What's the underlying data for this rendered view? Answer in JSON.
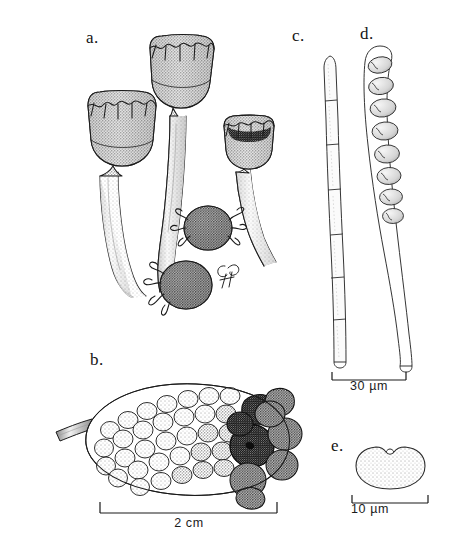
{
  "figure": {
    "type": "scientific-illustration-plate",
    "background_color": "#ffffff",
    "ink_color": "#1a1a1a",
    "signature": "GH"
  },
  "panels": [
    {
      "id": "a",
      "label": "a.",
      "subject": "stalked cup-shaped apothecia arising from sclerotia",
      "scale_bar": null
    },
    {
      "id": "b",
      "label": "b.",
      "subject": "mummified fruit encrusted with sclerotia, with pedicel",
      "scale_bar": {
        "text": "2 cm",
        "value": 2,
        "unit": "cm"
      }
    },
    {
      "id": "c",
      "label": "c.",
      "subject": "septate paraphysis",
      "scale_bar": {
        "text": "30 µm",
        "value": 30,
        "unit": "µm"
      }
    },
    {
      "id": "d",
      "label": "d.",
      "subject": "ascus containing eight ascospores",
      "scale_bar": {
        "text": "30 µm",
        "value": 30,
        "unit": "µm"
      }
    },
    {
      "id": "e",
      "label": "e.",
      "subject": "germinating ascospore with bud",
      "scale_bar": {
        "text": "10 µm",
        "value": 10,
        "unit": "µm"
      }
    }
  ],
  "scale_bars": {
    "panel_b": "2 cm",
    "panel_cd": "30 µm",
    "panel_e": "10 µm"
  },
  "labels": {
    "a": "a.",
    "b": "b.",
    "c": "c.",
    "d": "d.",
    "e": "e."
  }
}
